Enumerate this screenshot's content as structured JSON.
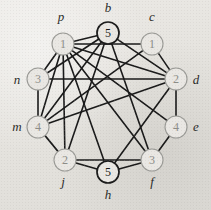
{
  "figure": {
    "kind": "graph-diagram",
    "background_color": "#e6e4e0",
    "edge_color": "#1a1a1a",
    "node_fill": "#e9e7e3",
    "node_stroke_dark": "#1a1a1a",
    "node_stroke_light": "#9a9a96",
    "node_text_dark": "#1a1a1a",
    "node_text_light": "#8d8d88",
    "label_color": "#2a2a28",
    "node_radius": 11,
    "edge_width": 1.6
  },
  "nodes": [
    {
      "id": "p",
      "label": "p",
      "value": "1",
      "cx": 63,
      "cy": 44,
      "tone": "light",
      "label_x": 61,
      "label_y": 21
    },
    {
      "id": "b",
      "label": "b",
      "value": "5",
      "cx": 108,
      "cy": 33,
      "tone": "dark",
      "label_x": 108,
      "label_y": 12
    },
    {
      "id": "c",
      "label": "c",
      "value": "1",
      "cx": 152,
      "cy": 44,
      "tone": "light",
      "label_x": 152,
      "label_y": 21
    },
    {
      "id": "d",
      "label": "d",
      "value": "2",
      "cx": 176,
      "cy": 79,
      "tone": "light",
      "label_x": 196,
      "label_y": 84
    },
    {
      "id": "e",
      "label": "e",
      "value": "4",
      "cx": 176,
      "cy": 127,
      "tone": "light",
      "label_x": 196,
      "label_y": 131
    },
    {
      "id": "f",
      "label": "f",
      "value": "3",
      "cx": 152,
      "cy": 160,
      "tone": "light",
      "label_x": 152,
      "label_y": 186
    },
    {
      "id": "h",
      "label": "h",
      "value": "5",
      "cx": 108,
      "cy": 172,
      "tone": "dark",
      "label_x": 108,
      "label_y": 199
    },
    {
      "id": "j",
      "label": "j",
      "value": "2",
      "cx": 65,
      "cy": 160,
      "tone": "light",
      "label_x": 63,
      "label_y": 186
    },
    {
      "id": "m",
      "label": "m",
      "value": "4",
      "cx": 38,
      "cy": 127,
      "tone": "light",
      "label_x": 17,
      "label_y": 131
    },
    {
      "id": "n",
      "label": "n",
      "value": "3",
      "cx": 38,
      "cy": 79,
      "tone": "light",
      "label_x": 17,
      "label_y": 84
    }
  ],
  "edges": [
    {
      "from": "p",
      "to": "b"
    },
    {
      "from": "p",
      "to": "c"
    },
    {
      "from": "p",
      "to": "d"
    },
    {
      "from": "p",
      "to": "e"
    },
    {
      "from": "p",
      "to": "f"
    },
    {
      "from": "p",
      "to": "h"
    },
    {
      "from": "p",
      "to": "j"
    },
    {
      "from": "p",
      "to": "m"
    },
    {
      "from": "p",
      "to": "n"
    },
    {
      "from": "b",
      "to": "d"
    },
    {
      "from": "b",
      "to": "f"
    },
    {
      "from": "b",
      "to": "j"
    },
    {
      "from": "b",
      "to": "m"
    },
    {
      "from": "b",
      "to": "n"
    },
    {
      "from": "c",
      "to": "d"
    },
    {
      "from": "c",
      "to": "m"
    },
    {
      "from": "d",
      "to": "e"
    },
    {
      "from": "d",
      "to": "m"
    },
    {
      "from": "d",
      "to": "n"
    },
    {
      "from": "d",
      "to": "h"
    },
    {
      "from": "e",
      "to": "f"
    },
    {
      "from": "f",
      "to": "h"
    },
    {
      "from": "f",
      "to": "j"
    },
    {
      "from": "h",
      "to": "j"
    },
    {
      "from": "m",
      "to": "n"
    },
    {
      "from": "m",
      "to": "j"
    }
  ],
  "accessible_summary": {
    "node_count": "10",
    "edge_count": "26",
    "node_labels": "p, b, c, d, e, f, h, j, m, n",
    "node_values": "1, 5, 1, 2, 4, 3, 5, 2, 4, 3"
  }
}
